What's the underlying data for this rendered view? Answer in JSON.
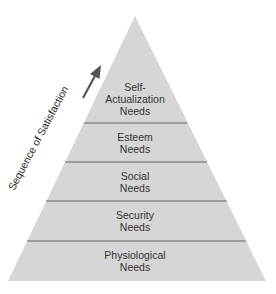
{
  "diagram": {
    "type": "pyramid",
    "side_label": "Sequence of Satisfaction",
    "levels": [
      {
        "line1": "Self-",
        "line2": "Actualization",
        "line3": "Needs"
      },
      {
        "line1": "Esteem",
        "line2": "Needs"
      },
      {
        "line1": "Social",
        "line2": "Needs"
      },
      {
        "line1": "Security",
        "line2": "Needs"
      },
      {
        "line1": "Physiological",
        "line2": "Needs"
      }
    ],
    "colors": {
      "fill": "#d6d6d6",
      "divider": "#555555",
      "text": "#333333",
      "arrow": "#555555"
    }
  }
}
